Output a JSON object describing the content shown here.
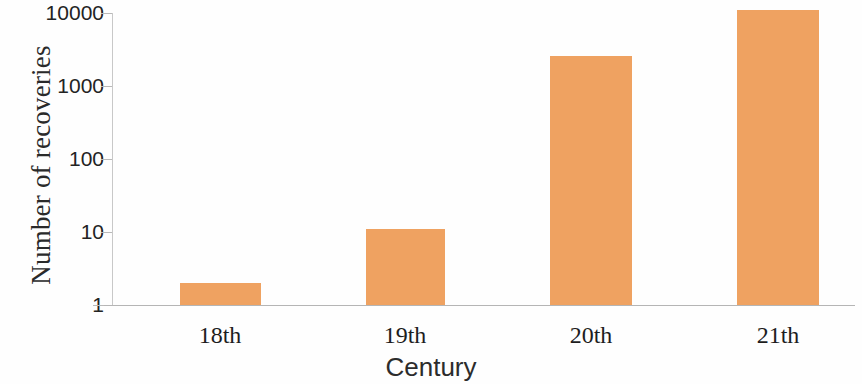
{
  "chart_data": {
    "type": "bar",
    "title": "",
    "xlabel": "Century",
    "ylabel": "Number of recoveries",
    "categories": [
      "18th",
      "19th",
      "20th",
      "21th"
    ],
    "values": [
      2,
      11,
      2600,
      11000
    ],
    "yscale": "log",
    "ylim": [
      1,
      10000
    ],
    "ytick_labels": [
      "1",
      "10",
      "100",
      "1000",
      "10000"
    ],
    "ytick_values": [
      1,
      10,
      100,
      1000,
      10000
    ],
    "grid": false,
    "legend": null,
    "bar_color": "#efa261",
    "axis_color": "#b9b9b9",
    "series": [
      {
        "name": "Number of recoveries",
        "values": [
          2,
          11,
          2600,
          11000
        ]
      }
    ]
  },
  "axes": {
    "y_title": "Number of recoveries",
    "x_title": "Century"
  }
}
